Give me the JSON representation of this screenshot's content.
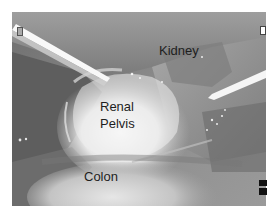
{
  "image": {
    "type": "grayscale laparoscopic surgical photograph",
    "background": "#ffffff",
    "tones": {
      "dark_left": "#5a5a5a",
      "mid_gray": "#8a8a8a",
      "bright_pelvis": "#f2f2f2",
      "instrument_highlight": "#ffffff"
    }
  },
  "labels": {
    "kidney": "Kidney",
    "renal_pelvis_line1": "Renal",
    "renal_pelvis_line2": "Pelvis",
    "colon": "Colon"
  },
  "overlay_markers": {
    "top_left": "indicator-rectangle",
    "top_right": "indicator-rectangle",
    "bottom_right": [
      "black-square",
      "black-square"
    ]
  }
}
